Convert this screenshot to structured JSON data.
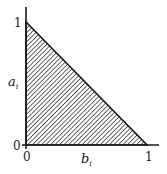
{
  "diagram": {
    "type": "region-plot",
    "x_axis": {
      "label": "b",
      "label_subscript": "i",
      "ticks": [
        "0",
        "1"
      ]
    },
    "y_axis": {
      "label": "a",
      "label_subscript": "i",
      "ticks": [
        "0",
        "1"
      ]
    },
    "region": {
      "vertices": [
        [
          0,
          1
        ],
        [
          0,
          0
        ],
        [
          1,
          0
        ]
      ],
      "fill": "diagonal-hatch"
    },
    "colors": {
      "ink": "#1a1a1a",
      "background": "#ffffff"
    }
  }
}
